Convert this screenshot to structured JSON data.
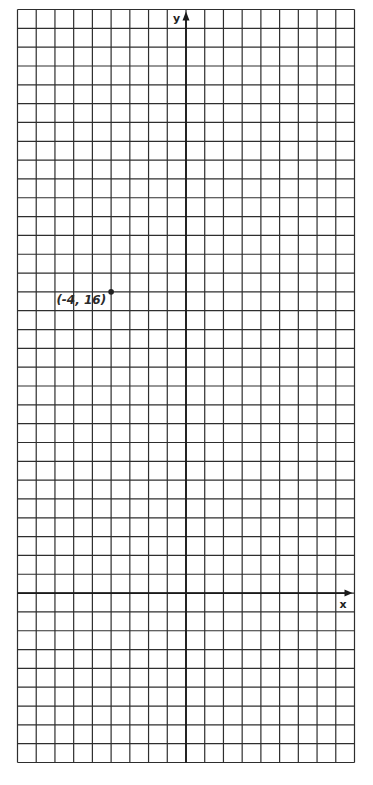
{
  "chart_data": {
    "type": "scatter",
    "title": "",
    "xlabel": "x",
    "ylabel": "y",
    "xlim": [
      -9,
      9
    ],
    "ylim": [
      -9,
      31
    ],
    "grid": true,
    "grid_step": 1,
    "points": [
      {
        "x": -4,
        "y": 16,
        "label": "(-4, 16)"
      }
    ]
  }
}
